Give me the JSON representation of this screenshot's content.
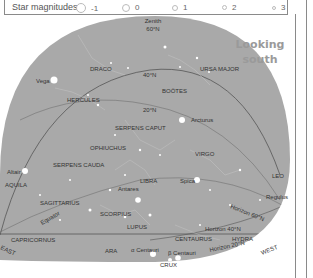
{
  "legend": {
    "title": "Star magnitudes",
    "magnitudes": [
      {
        "label": "-1",
        "size": 9
      },
      {
        "label": "0",
        "size": 7
      },
      {
        "label": "1",
        "size": 5
      },
      {
        "label": "2",
        "size": 4
      },
      {
        "label": "3",
        "size": 2
      }
    ]
  },
  "chart": {
    "direction_title": [
      "Looking",
      "south"
    ],
    "zenith": [
      "Zenith",
      "60°N"
    ],
    "compass": {
      "east": "EAST",
      "west": "WEST"
    },
    "latitude_lines": [
      "40°N",
      "20°N"
    ],
    "equator_label": "Equator",
    "horizons": [
      "Horizon 60°N",
      "Horizon 40°N",
      "Horizon 20°N"
    ],
    "constellations": [
      "DRACO",
      "URSA MAJOR",
      "BOÖTES",
      "HERCULES",
      "SERPENS CAPUT",
      "OPHIUCHUS",
      "SERPENS CAUDA",
      "AQUILA",
      "VIRGO",
      "LEO",
      "LIBRA",
      "SAGITTARIUS",
      "SCORPIUS",
      "LUPUS",
      "CAPRICORNUS",
      "ARA",
      "CENTAURUS",
      "HYDRA",
      "CRUX"
    ],
    "stars": [
      "Vega",
      "Arcturus",
      "Altair",
      "Spica",
      "Antares",
      "Regulus",
      "α Centauri",
      "β Centauri"
    ],
    "colors": {
      "sky": "#a9a9a9",
      "line": "#666666",
      "star": "#ffffff",
      "label": "#333333"
    }
  }
}
